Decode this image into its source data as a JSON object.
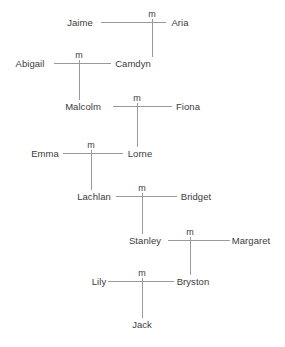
{
  "diagram": {
    "type": "family-tree",
    "line_color": "#9a9a9a",
    "text_color": "#3b3b3b",
    "background_color": "#ffffff",
    "marriage_symbol": "m",
    "generations": [
      {
        "index": 1,
        "y": 22,
        "left": {
          "name": "Jaime",
          "x": 80
        },
        "right": {
          "name": "Aria",
          "x": 180
        },
        "marriage": {
          "label": "m",
          "x": 152,
          "y": 14
        }
      },
      {
        "index": 2,
        "y": 63,
        "left": {
          "name": "Abigail",
          "x": 30
        },
        "right": {
          "name": "Camdyn",
          "x": 133
        },
        "marriage": {
          "label": "m",
          "x": 79,
          "y": 55
        }
      },
      {
        "index": 3,
        "y": 106,
        "left": {
          "name": "Malcolm",
          "x": 83
        },
        "right": {
          "name": "Fiona",
          "x": 188
        },
        "marriage": {
          "label": "m",
          "x": 137,
          "y": 98
        }
      },
      {
        "index": 4,
        "y": 153,
        "left": {
          "name": "Emma",
          "x": 45
        },
        "right": {
          "name": "Lorne",
          "x": 140
        },
        "marriage": {
          "label": "m",
          "x": 91,
          "y": 145
        }
      },
      {
        "index": 5,
        "y": 196,
        "left": {
          "name": "Lachlan",
          "x": 94
        },
        "right": {
          "name": "Bridget",
          "x": 196
        },
        "marriage": {
          "label": "m",
          "x": 142,
          "y": 188
        }
      },
      {
        "index": 6,
        "y": 240,
        "left": {
          "name": "Stanley",
          "x": 145
        },
        "right": {
          "name": "Margaret",
          "x": 251
        },
        "marriage": {
          "label": "m",
          "x": 190,
          "y": 232
        }
      },
      {
        "index": 7,
        "y": 281,
        "left": {
          "name": "Lily",
          "x": 99
        },
        "right": {
          "name": "Bryston",
          "x": 193
        },
        "marriage": {
          "label": "m",
          "x": 142,
          "y": 273
        }
      },
      {
        "index": 8,
        "y": 324,
        "only": {
          "name": "Jack",
          "x": 142
        }
      }
    ],
    "people": [
      "Jaime",
      "Aria",
      "Abigail",
      "Camdyn",
      "Malcolm",
      "Fiona",
      "Emma",
      "Lorne",
      "Lachlan",
      "Bridget",
      "Stanley",
      "Margaret",
      "Lily",
      "Bryston",
      "Jack"
    ],
    "marriages": [
      {
        "spouse_a": "Jaime",
        "spouse_b": "Aria",
        "label": "m",
        "children": [
          "Camdyn"
        ]
      },
      {
        "spouse_a": "Abigail",
        "spouse_b": "Camdyn",
        "label": "m",
        "children": [
          "Malcolm"
        ]
      },
      {
        "spouse_a": "Malcolm",
        "spouse_b": "Fiona",
        "label": "m",
        "children": [
          "Lorne"
        ]
      },
      {
        "spouse_a": "Emma",
        "spouse_b": "Lorne",
        "label": "m",
        "children": [
          "Lachlan"
        ]
      },
      {
        "spouse_a": "Lachlan",
        "spouse_b": "Bridget",
        "label": "m",
        "children": [
          "Stanley"
        ]
      },
      {
        "spouse_a": "Stanley",
        "spouse_b": "Margaret",
        "label": "m",
        "children": [
          "Bryston"
        ]
      },
      {
        "spouse_a": "Lily",
        "spouse_b": "Bryston",
        "label": "m",
        "children": [
          "Jack"
        ]
      }
    ],
    "spouse_lines": [
      {
        "name": "spouse-line-jaime-aria",
        "x1": 101,
        "x2": 166,
        "y": 22
      },
      {
        "name": "spouse-line-abigail-camdyn",
        "x1": 54,
        "x2": 111,
        "y": 63
      },
      {
        "name": "spouse-line-malcolm-fiona",
        "x1": 113,
        "x2": 172,
        "y": 106
      },
      {
        "name": "spouse-line-emma-lorne",
        "x1": 63,
        "x2": 123,
        "y": 153
      },
      {
        "name": "spouse-line-lachlan-bridget",
        "x1": 116,
        "x2": 177,
        "y": 196
      },
      {
        "name": "spouse-line-stanley-margaret",
        "x1": 168,
        "x2": 230,
        "y": 240
      },
      {
        "name": "spouse-line-lily-bryston",
        "x1": 108,
        "x2": 174,
        "y": 281
      }
    ],
    "descent_lines": [
      {
        "name": "descent-line-jaime-aria-to-camdyn",
        "x": 152,
        "y1": 22,
        "y2": 57
      },
      {
        "name": "descent-line-abigail-camdyn-to-malcolm",
        "x": 79,
        "y1": 63,
        "y2": 100
      },
      {
        "name": "descent-line-malcolm-fiona-to-lorne",
        "x": 137,
        "y1": 106,
        "y2": 147
      },
      {
        "name": "descent-line-emma-lorne-to-lachlan",
        "x": 91,
        "y1": 153,
        "y2": 190
      },
      {
        "name": "descent-line-lachlan-bridget-to-stanley",
        "x": 142,
        "y1": 196,
        "y2": 234
      },
      {
        "name": "descent-line-stanley-margaret-to-bryston",
        "x": 190,
        "y1": 240,
        "y2": 275
      },
      {
        "name": "descent-line-lily-bryston-to-jack",
        "x": 142,
        "y1": 281,
        "y2": 318
      }
    ],
    "marriage_ticks": [
      {
        "name": "marriage-tick-jaime-aria",
        "x": 152,
        "y1": 18,
        "y2": 22
      },
      {
        "name": "marriage-tick-abigail-camdyn",
        "x": 79,
        "y1": 59,
        "y2": 63
      },
      {
        "name": "marriage-tick-malcolm-fiona",
        "x": 137,
        "y1": 102,
        "y2": 106
      },
      {
        "name": "marriage-tick-emma-lorne",
        "x": 91,
        "y1": 149,
        "y2": 153
      },
      {
        "name": "marriage-tick-lachlan-bridget",
        "x": 142,
        "y1": 192,
        "y2": 196
      },
      {
        "name": "marriage-tick-stanley-margaret",
        "x": 190,
        "y1": 236,
        "y2": 240
      },
      {
        "name": "marriage-tick-lily-bryston",
        "x": 142,
        "y1": 277,
        "y2": 281
      }
    ]
  }
}
